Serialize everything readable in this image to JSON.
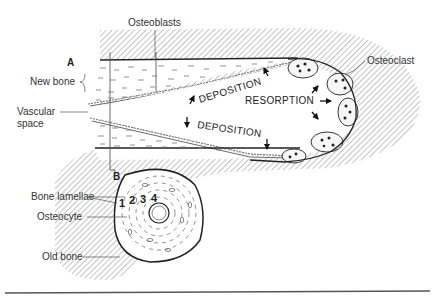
{
  "figure": {
    "panel_labels": {
      "a": "A",
      "b": "B"
    },
    "labels": {
      "osteoblasts": "Osteoblasts",
      "osteoclast": "Osteoclast",
      "new_bone": "New bone",
      "vascular_space_line1": "Vascular",
      "vascular_space_line2": "space",
      "bone_lamellae": "Bone lamellae",
      "osteocyte": "Osteocyte",
      "old_bone": "Old bone"
    },
    "processes": {
      "deposition_upper": "DEPOSITION",
      "deposition_lower": "DEPOSITION",
      "resorption": "RESORPTION"
    },
    "lamella_numbers": [
      "1",
      "2",
      "3",
      "4"
    ],
    "colors": {
      "ink": "#222222",
      "hatch": "#888888",
      "background": "#ffffff"
    }
  }
}
